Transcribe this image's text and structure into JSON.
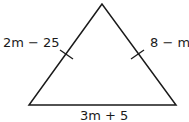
{
  "diagram": {
    "type": "isosceles-triangle",
    "vertices": {
      "apex": [
        102,
        4
      ],
      "bottom_left": [
        29,
        105
      ],
      "bottom_right": [
        176,
        105
      ]
    },
    "stroke_color": "#1a1a1a",
    "sides": {
      "left": {
        "label": "2m − 25",
        "tick_mark": true
      },
      "right": {
        "label": "8 − m",
        "tick_mark": true
      },
      "base": {
        "label": "3m + 5",
        "tick_mark": false
      }
    }
  }
}
